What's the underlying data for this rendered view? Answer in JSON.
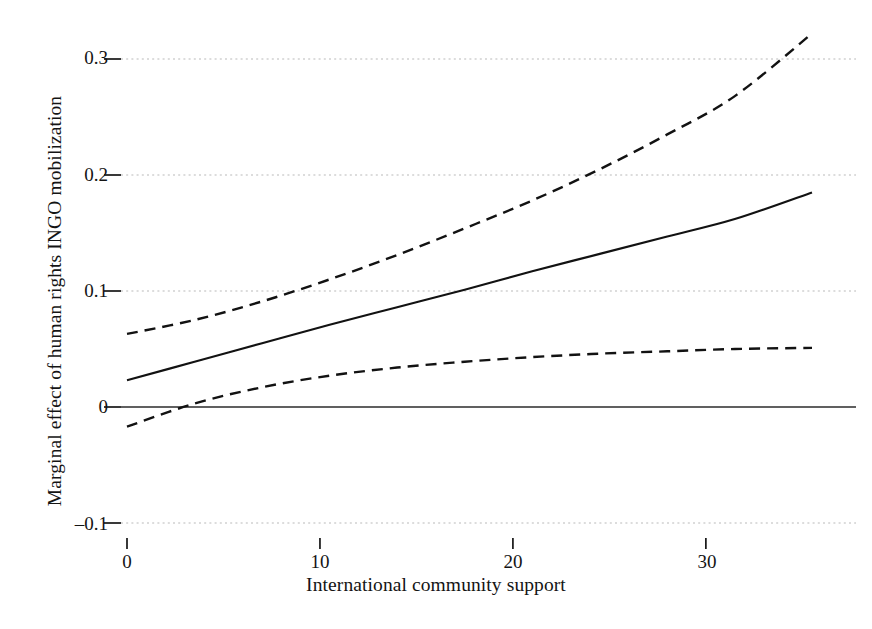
{
  "chart_data": {
    "type": "line",
    "title": "",
    "xlabel": "International community support",
    "ylabel": "Marginal effect of human rights INGO mobilization",
    "xlim": [
      -1.5,
      36.8
    ],
    "ylim": [
      -0.125,
      0.345
    ],
    "xticks": [
      0,
      10,
      20,
      30
    ],
    "xticklabels": [
      "0",
      "10",
      "20",
      "30"
    ],
    "yticks": [
      -0.1,
      0,
      0.1,
      0.2,
      0.3
    ],
    "yticklabels": [
      "–0.1",
      "0",
      "0.1",
      "0.2",
      "0.3"
    ],
    "grid": "horizontal-dotted",
    "legend": "none",
    "reference_line": {
      "y": 0,
      "style": "solid",
      "label": "zero-effect-line"
    },
    "x": [
      0,
      3.5,
      7,
      10.5,
      14,
      17.5,
      21,
      24.5,
      28,
      31.5,
      35.5
    ],
    "series": [
      {
        "name": "Marginal effect (point estimate)",
        "style": "solid",
        "values": [
          0.023,
          0.039,
          0.055,
          0.071,
          0.086,
          0.101,
          0.117,
          0.132,
          0.147,
          0.162,
          0.185
        ]
      },
      {
        "name": "Upper 95% confidence bound",
        "style": "dashed",
        "values": [
          0.063,
          0.075,
          0.091,
          0.11,
          0.131,
          0.154,
          0.178,
          0.205,
          0.235,
          0.268,
          0.322
        ]
      },
      {
        "name": "Lower 95% confidence bound",
        "style": "dashed",
        "values": [
          -0.017,
          0.003,
          0.017,
          0.027,
          0.034,
          0.039,
          0.043,
          0.046,
          0.048,
          0.05,
          0.051
        ]
      }
    ],
    "annotations": [
      {
        "text": "lower bound crosses zero",
        "x": 2.6,
        "y": 0.0
      }
    ]
  }
}
